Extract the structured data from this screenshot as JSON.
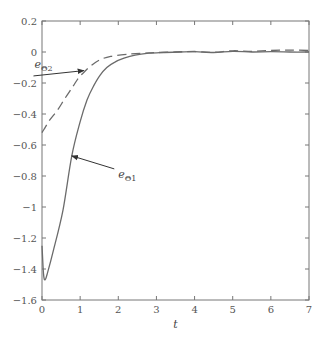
{
  "chart_data": {
    "type": "line",
    "title": "",
    "xlabel": "t",
    "ylabel": "",
    "xlim": [
      0,
      7
    ],
    "ylim": [
      -1.6,
      0.2
    ],
    "grid": false,
    "legend": "none (inline arrow annotations)",
    "x_ticks": [
      0,
      1,
      2,
      3,
      4,
      5,
      6,
      7
    ],
    "x_tick_labels": [
      "0",
      "1",
      "2",
      "3",
      "4",
      "5",
      "6",
      "7"
    ],
    "y_ticks": [
      0.2,
      0,
      -0.2,
      -0.4,
      -0.6,
      -0.8,
      -1,
      -1.2,
      -1.4,
      -1.6
    ],
    "y_tick_labels": [
      "0.2",
      "0",
      "−0.2",
      "−0.4",
      "−0.6",
      "−0.8",
      "−1",
      "−1.2",
      "−1.4",
      "−1.6"
    ],
    "series": [
      {
        "name": "e_Θ1",
        "style": "solid",
        "color": "#6b6b6b",
        "x": [
          0,
          0.04,
          0.08,
          0.15,
          0.3,
          0.55,
          0.78,
          1.0,
          1.18,
          1.35,
          1.52,
          1.7,
          1.91,
          2.15,
          2.44,
          2.8,
          3.2,
          3.6,
          4.0,
          4.5,
          5.0,
          5.5,
          6.0,
          6.5,
          7.0
        ],
        "values": [
          -1.25,
          -1.43,
          -1.47,
          -1.42,
          -1.28,
          -1.02,
          -0.67,
          -0.45,
          -0.31,
          -0.22,
          -0.15,
          -0.1,
          -0.065,
          -0.04,
          -0.02,
          -0.008,
          -0.003,
          0.0,
          0.002,
          -0.003,
          0.004,
          0.0,
          0.002,
          0.0,
          0.0
        ]
      },
      {
        "name": "e_Θ2",
        "style": "dashed",
        "color": "#6b6b6b",
        "x": [
          0,
          0.05,
          0.2,
          0.42,
          0.6,
          0.79,
          0.95,
          1.1,
          1.3,
          1.52,
          1.8,
          2.3,
          2.7,
          3.0,
          3.5,
          4.0,
          4.5,
          5.0,
          5.5,
          6.0,
          6.5,
          7.0
        ],
        "values": [
          -0.52,
          -0.5,
          -0.44,
          -0.37,
          -0.3,
          -0.23,
          -0.17,
          -0.13,
          -0.085,
          -0.05,
          -0.028,
          -0.013,
          -0.007,
          -0.004,
          0.0,
          0.003,
          -0.002,
          0.008,
          0.004,
          0.01,
          0.012,
          0.01
        ]
      }
    ],
    "annotations": [
      {
        "text": "e",
        "subscript": "Θ2",
        "series": "e_Θ2",
        "label_at": [
          0.17,
          -0.09
        ],
        "arrow_to": [
          1.1,
          -0.12
        ]
      },
      {
        "text": "e",
        "subscript": "Θ1",
        "series": "e_Θ1",
        "label_at": [
          2.0,
          -0.78
        ],
        "arrow_to": [
          0.78,
          -0.67
        ]
      }
    ]
  },
  "layout": {
    "plot": {
      "left": 42,
      "top": 21,
      "right": 309,
      "bottom": 300
    },
    "axis_color": "#777777",
    "line_color": "#6b6b6b"
  }
}
